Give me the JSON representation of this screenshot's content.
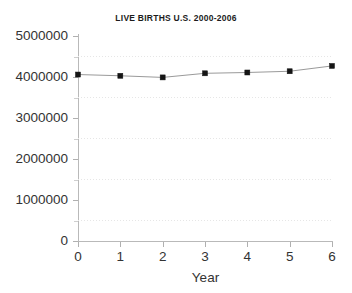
{
  "chart_data": {
    "type": "line",
    "title": "LIVE BIRTHS U.S. 2000-2006",
    "xlabel": "Year",
    "ylabel": "",
    "x": [
      0,
      1,
      2,
      3,
      4,
      5,
      6
    ],
    "categories": [
      "0",
      "1",
      "2",
      "3",
      "4",
      "5",
      "6"
    ],
    "values": [
      4060000,
      4030000,
      3990000,
      4090000,
      4110000,
      4140000,
      4270000
    ],
    "series": [
      {
        "name": "Live births",
        "values": [
          4060000,
          4030000,
          3990000,
          4090000,
          4110000,
          4140000,
          4270000
        ]
      }
    ],
    "xlim": [
      0,
      6
    ],
    "ylim": [
      0,
      5000000
    ],
    "ytick_labels": [
      "0",
      "1000000",
      "2000000",
      "3000000",
      "4000000",
      "5000000"
    ],
    "ytick_values": [
      0,
      1000000,
      2000000,
      3000000,
      4000000,
      5000000
    ],
    "xtick_labels": [
      "0",
      "1",
      "2",
      "3",
      "4",
      "5",
      "6"
    ],
    "xtick_values": [
      0,
      1,
      2,
      3,
      4,
      5,
      6
    ],
    "minor_gridline_values": [
      500000,
      1500000,
      2500000,
      3500000,
      4500000
    ],
    "grid": true,
    "grid_style": "dotted-minor-horizontal",
    "legend": false,
    "legend_position": "none",
    "marker": "square",
    "line_color": "#9a9a9a",
    "marker_color": "#151515",
    "background_color": "#ffffff",
    "axis_color": "#b9b9b9",
    "grid_color": "#e6e6e6",
    "text_color": "#333333"
  }
}
